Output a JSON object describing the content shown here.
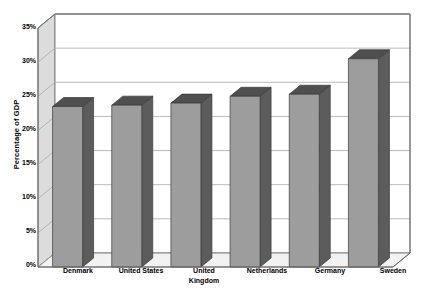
{
  "chart_data": {
    "type": "bar",
    "title": "",
    "subtitle": "",
    "xlabel": "",
    "ylabel": "Percentage of GDP",
    "categories": [
      "Denmark",
      "United States",
      "United Kingdom",
      "Netherlands",
      "Germany",
      "Sweden"
    ],
    "values": [
      23.5,
      23.7,
      24.0,
      25.0,
      25.3,
      30.5
    ],
    "series": [
      {
        "name": "Percentage of GDP",
        "values": [
          23.5,
          23.7,
          24.0,
          25.0,
          25.3,
          30.5
        ]
      }
    ],
    "ylim": [
      0,
      35
    ],
    "ytick_values": [
      0,
      5,
      10,
      15,
      20,
      25,
      30,
      35
    ],
    "ytick_labels": [
      "0%",
      "5%",
      "10%",
      "15%",
      "20%",
      "25%",
      "30%",
      "35%"
    ],
    "grid": true,
    "grid_axis": "y",
    "legend": false,
    "legend_position": "none",
    "style": "3d-column",
    "annotations": []
  },
  "axis": {
    "y_title": "Percentage of GDP",
    "ticks": [
      {
        "label": "35%",
        "value": 35
      },
      {
        "label": "30%",
        "value": 30
      },
      {
        "label": "25%",
        "value": 25
      },
      {
        "label": "20%",
        "value": 20
      },
      {
        "label": "15%",
        "value": 15
      },
      {
        "label": "10%",
        "value": 10
      },
      {
        "label": "5%",
        "value": 5
      },
      {
        "label": "0%",
        "value": 0
      }
    ]
  },
  "categories": [
    {
      "label": "Denmark"
    },
    {
      "label": "United States"
    },
    {
      "label": "United\nKingdom"
    },
    {
      "label": "Netherlands"
    },
    {
      "label": "Germany"
    },
    {
      "label": "Sweden"
    }
  ],
  "colors": {
    "bar_front": "#9d9d9d",
    "bar_side": "#5c5c5c",
    "bar_top": "#4f4f4f",
    "wall_back": "#ffffff",
    "wall_left": "#dcdcdc",
    "floor": "#f2f2f2",
    "gridline": "#a8a8a8",
    "axis_line": "#6b6b6b",
    "text": "#000000"
  }
}
